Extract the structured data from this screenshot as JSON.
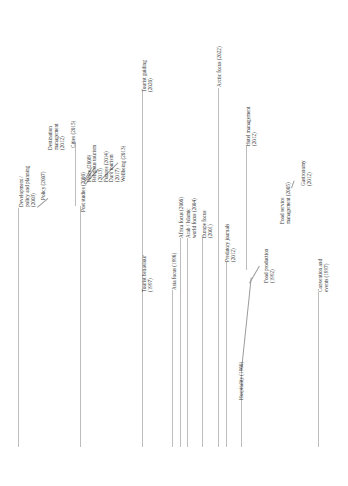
{
  "diagram": {
    "type": "rotated-timeline-tree",
    "orientation": "rotated 90deg counter-clockwise",
    "line_color": "#bdbdbd",
    "text_color": "#333333",
    "branches": [
      {
        "id": "development",
        "label": "Development /\npolicy and planning\n(2003)",
        "line_x": 18,
        "children": [
          {
            "label": "Policy (2007)"
          },
          {
            "label": "Destination\nmanagement\n(2012)"
          },
          {
            "label": "Cities (2015)"
          }
        ]
      },
      {
        "id": "post-studies",
        "label": "Post studies (2000)",
        "line_x": 80,
        "children": [
          {
            "label": "Peace (2008)"
          },
          {
            "label": "Religious tourism\n(2013)"
          },
          {
            "label": "Futures (2014)"
          },
          {
            "label": "Dark tourism\n(2017)"
          },
          {
            "label": "Wellbeing (2013)"
          }
        ]
      },
      {
        "id": "tourist-guiding",
        "label": "Tourist guiding\n(2020)",
        "line_x": 142
      },
      {
        "id": "tourist-behaviour",
        "label": "Tourist behaviour\n(1997)",
        "line_x": 142
      },
      {
        "id": "asia-focus",
        "label": "Asia focus (1996)",
        "line_x": 172
      },
      {
        "id": "africa-focus",
        "label": "Africa focus (2006)",
        "line_x": 180
      },
      {
        "id": "arab-islamic",
        "label": "Arab / Islamic\nworld focus (2004)",
        "line_x": 187
      },
      {
        "id": "europe-focus",
        "label": "Europe focus\n(2001)",
        "line_x": 202
      },
      {
        "id": "arctic-focus",
        "label": "Arctic focus (2022)",
        "line_x": 218
      },
      {
        "id": "predatory-journals",
        "label": "Predatory journals\n(2012)",
        "line_x": 226
      },
      {
        "id": "hospitality",
        "label": "Hospitality (1960)",
        "line_x": 241,
        "children": [
          {
            "label": "Hotel management\n(2012)"
          },
          {
            "label": "Food production\n(1992)"
          },
          {
            "label": "Food service\nmanagement (2005)"
          },
          {
            "label": "Gastronomy\n(2012)"
          }
        ]
      },
      {
        "id": "convention-events",
        "label": "Convention and\nevents (1997)",
        "line_x": 318
      }
    ]
  },
  "labels": {
    "development": "Development /\npolicy and planning\n(2003)",
    "policy": "Policy (2007)",
    "destination_management": "Destination\nmanagement\n(2012)",
    "cities": "Cities (2015)",
    "post_studies": "Post studies (2000)",
    "peace": "Peace (2008)",
    "religious_tourism": "Religious tourism\n(2013)",
    "futures": "Futures (2014)",
    "dark_tourism": "Dark tourism\n(2017)",
    "wellbeing": "Wellbeing (2013)",
    "tourist_guiding": "Tourist guiding\n(2020)",
    "tourist_behaviour": "Tourist behaviour\n(1997)",
    "asia_focus": "Asia focus (1996)",
    "africa_focus": "Africa focus (2006)",
    "arab_islamic": "Arab / Islamic\nworld focus (2004)",
    "europe_focus": "Europe focus\n(2001)",
    "arctic_focus": "Arctic focus (2022)",
    "predatory_journals": "Predatory journals\n(2012)",
    "hospitality": "Hospitality (1960)",
    "hotel_management": "Hotel management\n(2012)",
    "food_production": "Food production\n(1992)",
    "food_service": "Food service\nmanagement (2005)",
    "gastronomy": "Gastronomy\n(2012)",
    "convention_events": "Convention and\nevents (1997)"
  }
}
